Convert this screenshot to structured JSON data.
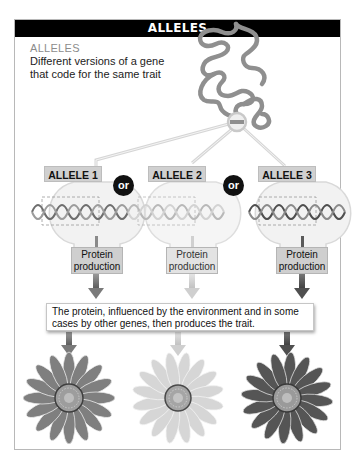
{
  "header": {
    "title": "ALLELES"
  },
  "intro": {
    "title": "ALLELES",
    "description": "Different versions of a gene that code for the same trait"
  },
  "alleles": [
    {
      "label": "ALLELE 1",
      "protein_label": "Protein production",
      "shade": "#8a8a8a"
    },
    {
      "label": "ALLELE 2",
      "protein_label": "Protein production",
      "shade": "#d4d4d4"
    },
    {
      "label": "ALLELE 3",
      "protein_label": "Protein production",
      "shade": "#5a5a5a"
    }
  ],
  "connectors": {
    "or_1": "or",
    "or_2": "or"
  },
  "trait_box": {
    "text": "The protein, influenced by the environment and in some cases by other genes, then produces the trait."
  },
  "icons": {
    "chromosome": "chromosome-squiggle-icon",
    "magnifier": "magnifier-circle-icon",
    "dna": "dna-helix-icon",
    "arrow": "arrow-down-icon",
    "flower": "sunflower-icon"
  },
  "colors": {
    "header_bg": "#000000",
    "intro_title": "#8c8c8c",
    "label_bg": "#d0d0d0",
    "flower_1": "#7f7f7f",
    "flower_2": "#cfcfcf",
    "flower_3": "#555555"
  }
}
